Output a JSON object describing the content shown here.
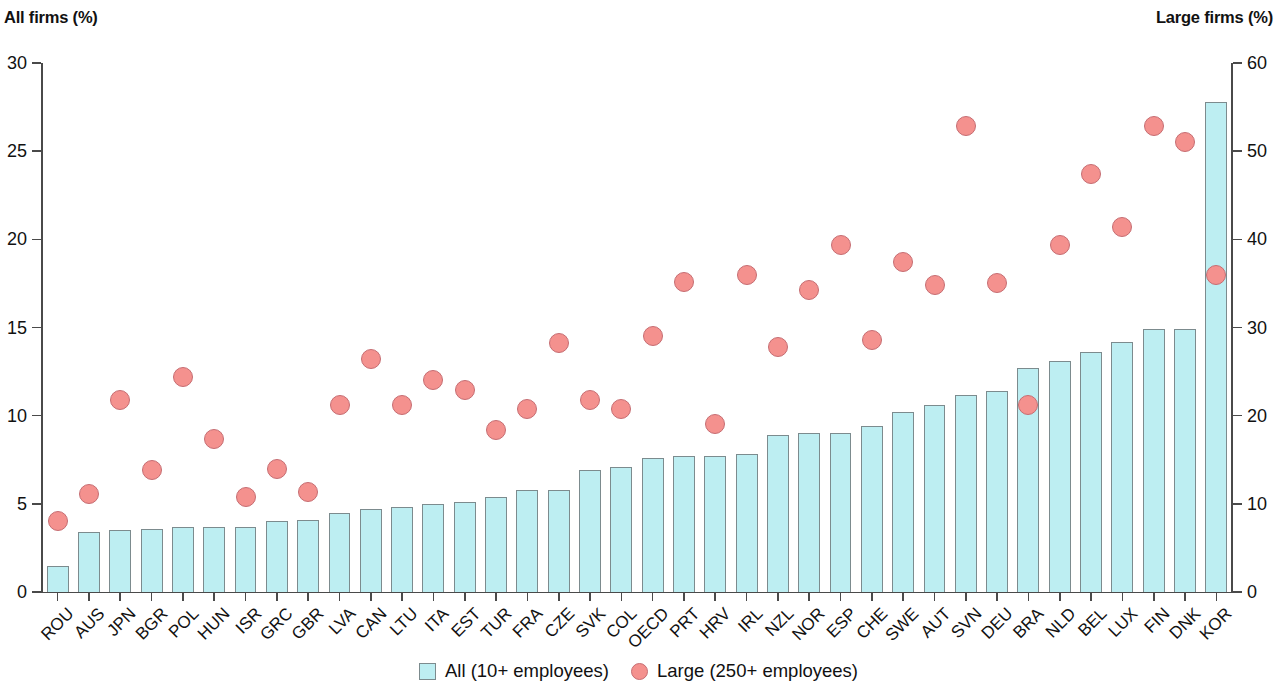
{
  "axes": {
    "left_title": "All firms (%)",
    "right_title": "Large firms (%)",
    "left_ticks": [
      "0",
      "5",
      "10",
      "15",
      "20",
      "25",
      "30"
    ],
    "right_ticks": [
      "0",
      "10",
      "20",
      "30",
      "40",
      "50",
      "60"
    ]
  },
  "legend": {
    "items": [
      {
        "label": "All (10+ employees)",
        "marker": "square-swatch",
        "color": "#bdeef2"
      },
      {
        "label": "Large (250+ employees)",
        "marker": "circle-swatch",
        "color": "#f4918e"
      }
    ]
  },
  "colors": {
    "bar_fill": "#bdeef2",
    "bar_stroke": "#7c8b8e",
    "dot_fill": "#f4918e",
    "dot_stroke": "#c66d72",
    "axis": "#4a4a4a",
    "text": "#111111"
  },
  "chart_data": {
    "type": "bar",
    "title": "",
    "xlabel": "",
    "ylabel": "All firms (%)",
    "y2label": "Large firms (%)",
    "ylim": [
      0,
      30
    ],
    "y2lim": [
      0,
      60
    ],
    "grid": false,
    "legend_position": "bottom-center",
    "categories": [
      "ROU",
      "AUS",
      "JPN",
      "BGR",
      "POL",
      "HUN",
      "ISR",
      "GRC",
      "GBR",
      "LVA",
      "CAN",
      "LTU",
      "ITA",
      "EST",
      "TUR",
      "FRA",
      "CZE",
      "SVK",
      "COL",
      "OECD",
      "PRT",
      "HRV",
      "IRL",
      "NZL",
      "NOR",
      "ESP",
      "CHE",
      "SWE",
      "AUT",
      "SVN",
      "DEU",
      "BRA",
      "NLD",
      "BEL",
      "LUX",
      "FIN",
      "DNK",
      "KOR"
    ],
    "series": [
      {
        "name": "All (10+ employees)",
        "type": "bar",
        "axis": "left",
        "values": [
          1.5,
          3.4,
          3.5,
          3.6,
          3.7,
          3.7,
          3.7,
          4.0,
          4.1,
          4.5,
          4.7,
          4.8,
          5.0,
          5.1,
          5.4,
          5.8,
          5.8,
          6.9,
          7.1,
          7.6,
          7.7,
          7.7,
          7.8,
          8.9,
          9.0,
          9.0,
          9.4,
          10.2,
          10.6,
          11.2,
          11.4,
          12.7,
          13.1,
          13.6,
          14.2,
          14.9,
          14.9,
          27.8
        ]
      },
      {
        "name": "Large (250+ employees)",
        "type": "scatter",
        "axis": "right",
        "values": [
          8.1,
          11.1,
          21.8,
          13.8,
          24.4,
          17.4,
          10.8,
          14.0,
          11.4,
          21.2,
          26.4,
          21.2,
          24.0,
          22.9,
          18.4,
          20.8,
          28.2,
          21.8,
          20.8,
          29.0,
          35.2,
          19.0,
          36.0,
          27.8,
          34.2,
          39.4,
          28.6,
          37.4,
          34.8,
          52.8,
          35.0,
          21.2,
          39.4,
          47.4,
          41.4,
          52.9,
          51.0,
          36.0
        ]
      }
    ]
  }
}
